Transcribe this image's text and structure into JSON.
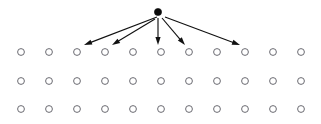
{
  "figure": {
    "background_color": "#ffffff",
    "width": 321,
    "height": 124
  },
  "source_node": {
    "label": "source-node",
    "fill_color": "#0a0a0a",
    "cx": 158,
    "cy": 12,
    "r": 3.6
  },
  "grid": {
    "label": "lattice-grid",
    "columns": 11,
    "rows": 3,
    "node_stroke_color": "#6b6b72",
    "node_fill_color": "#ffffff",
    "node_radius": 3.4,
    "column_x": [
      21,
      49,
      77,
      105,
      133,
      161,
      189,
      217,
      245,
      273,
      301
    ],
    "row_y": [
      52,
      81,
      109
    ]
  },
  "arrows": {
    "label": "diffusion-arrows",
    "color": "#111111",
    "count": 5,
    "items": [
      {
        "name": "arrow-to-col3",
        "x1": 157,
        "y1": 17,
        "x2": 84,
        "y2": 45,
        "target_column": 3
      },
      {
        "name": "arrow-to-col4",
        "x1": 155,
        "y1": 19,
        "x2": 112,
        "y2": 45,
        "target_column": 4
      },
      {
        "name": "arrow-to-col6",
        "x1": 158,
        "y1": 18,
        "x2": 158,
        "y2": 45,
        "target_column": 6
      },
      {
        "name": "arrow-to-col7",
        "x1": 162,
        "y1": 18,
        "x2": 185,
        "y2": 45,
        "target_column": 7
      },
      {
        "name": "arrow-to-col9",
        "x1": 165,
        "y1": 17,
        "x2": 240,
        "y2": 45,
        "target_column": 9
      }
    ]
  }
}
